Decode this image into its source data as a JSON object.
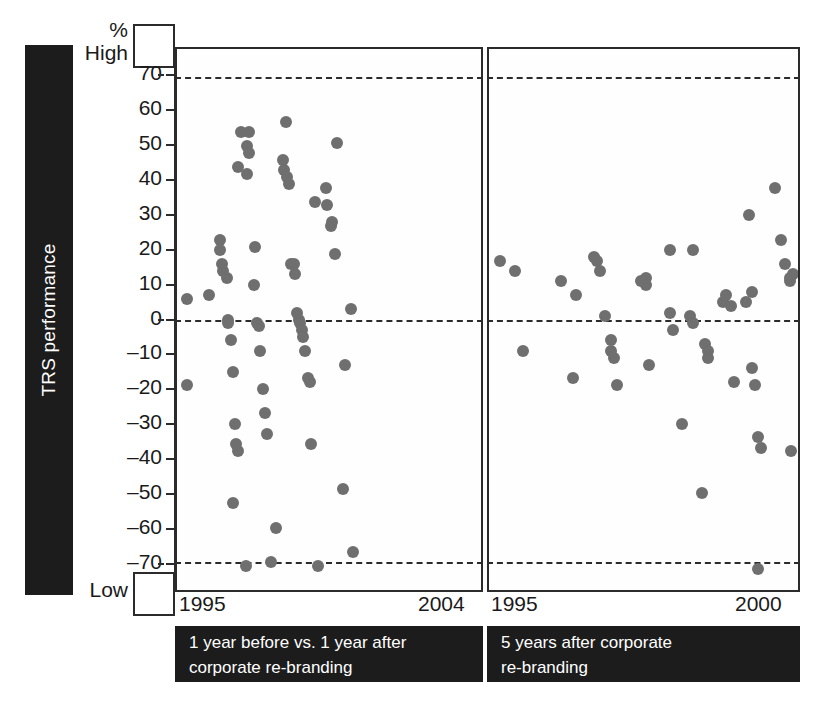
{
  "axis": {
    "y_title": "TRS performance",
    "unit_label": "%",
    "high_label": "High",
    "low_label": "Low",
    "y_ticks": [
      70,
      60,
      50,
      40,
      30,
      20,
      10,
      0,
      -10,
      -20,
      -30,
      -40,
      -50,
      -60,
      -70
    ],
    "y_tick_labels": [
      "70",
      "60",
      "50",
      "40",
      "30",
      "20",
      "10",
      "0",
      "–10",
      "–20",
      "–30",
      "–40",
      "–50",
      "–60",
      "–70"
    ]
  },
  "panels": {
    "left": {
      "x_start_label": "1995",
      "x_end_label": "2004",
      "caption_line1": "1 year before vs. 1 year after",
      "caption_line2": "corporate re-branding"
    },
    "right": {
      "x_start_label": "1995",
      "x_end_label": "2000",
      "caption_line1": "5 years after corporate",
      "caption_line2": "re-branding"
    }
  },
  "colors": {
    "dot": "#6f6f6f",
    "panel_border": "#2b2b2b",
    "caption_background": "#1c1c1c",
    "caption_text": "#ffffff",
    "background": "#ffffff"
  },
  "chart_data": [
    {
      "type": "scatter",
      "title": "1 year before vs. 1 year after corporate re-branding",
      "xlabel": "",
      "ylabel": "TRS performance",
      "xlim": [
        1995,
        2004
      ],
      "ylim": [
        -78,
        78
      ],
      "grid": false,
      "reference_lines": [
        70,
        0,
        -70
      ],
      "xticks": [
        1995,
        2004
      ],
      "yticks": [
        70,
        60,
        50,
        40,
        30,
        20,
        10,
        0,
        -10,
        -20,
        -30,
        -40,
        -50,
        -60,
        -70
      ],
      "points": [
        {
          "x": 1995.05,
          "y": 6
        },
        {
          "x": 1995.05,
          "y": -19
        },
        {
          "x": 1995.75,
          "y": 7
        },
        {
          "x": 1996.1,
          "y": 23
        },
        {
          "x": 1996.1,
          "y": 20
        },
        {
          "x": 1996.15,
          "y": 16
        },
        {
          "x": 1996.2,
          "y": 14
        },
        {
          "x": 1996.3,
          "y": 12
        },
        {
          "x": 1996.35,
          "y": 0
        },
        {
          "x": 1996.35,
          "y": -1
        },
        {
          "x": 1996.45,
          "y": -6
        },
        {
          "x": 1996.5,
          "y": -15
        },
        {
          "x": 1996.55,
          "y": -30
        },
        {
          "x": 1996.6,
          "y": -36
        },
        {
          "x": 1996.65,
          "y": -38
        },
        {
          "x": 1996.5,
          "y": -53
        },
        {
          "x": 1996.9,
          "y": -71
        },
        {
          "x": 1996.65,
          "y": 44
        },
        {
          "x": 1996.95,
          "y": 50
        },
        {
          "x": 1997.0,
          "y": 54
        },
        {
          "x": 1997.0,
          "y": 48
        },
        {
          "x": 1996.75,
          "y": 54
        },
        {
          "x": 1996.95,
          "y": 42
        },
        {
          "x": 1997.15,
          "y": 10
        },
        {
          "x": 1997.2,
          "y": 21
        },
        {
          "x": 1997.25,
          "y": -1
        },
        {
          "x": 1997.3,
          "y": -2
        },
        {
          "x": 1997.35,
          "y": -9
        },
        {
          "x": 1997.45,
          "y": -20
        },
        {
          "x": 1997.5,
          "y": -27
        },
        {
          "x": 1997.55,
          "y": -33
        },
        {
          "x": 1997.7,
          "y": -70
        },
        {
          "x": 1997.85,
          "y": -60
        },
        {
          "x": 1998.15,
          "y": 57
        },
        {
          "x": 1998.05,
          "y": 46
        },
        {
          "x": 1998.1,
          "y": 43
        },
        {
          "x": 1998.2,
          "y": 41
        },
        {
          "x": 1998.25,
          "y": 39
        },
        {
          "x": 1998.3,
          "y": 16
        },
        {
          "x": 1998.4,
          "y": 16
        },
        {
          "x": 1998.45,
          "y": 13
        },
        {
          "x": 1998.5,
          "y": 2
        },
        {
          "x": 1998.55,
          "y": 0
        },
        {
          "x": 1998.6,
          "y": -1
        },
        {
          "x": 1998.65,
          "y": -3
        },
        {
          "x": 1998.7,
          "y": -5
        },
        {
          "x": 1998.75,
          "y": -9
        },
        {
          "x": 1998.85,
          "y": -17
        },
        {
          "x": 1998.9,
          "y": -18
        },
        {
          "x": 1998.95,
          "y": -36
        },
        {
          "x": 1999.15,
          "y": -71
        },
        {
          "x": 1999.05,
          "y": 34
        },
        {
          "x": 1999.4,
          "y": 38
        },
        {
          "x": 1999.45,
          "y": 33
        },
        {
          "x": 1999.55,
          "y": 27
        },
        {
          "x": 1999.6,
          "y": 28
        },
        {
          "x": 1999.7,
          "y": 19
        },
        {
          "x": 1999.75,
          "y": 51
        },
        {
          "x": 1999.95,
          "y": -49
        },
        {
          "x": 2000.0,
          "y": -13
        },
        {
          "x": 2000.2,
          "y": 3
        },
        {
          "x": 2000.25,
          "y": -67
        }
      ]
    },
    {
      "type": "scatter",
      "title": "5 years after corporate re-branding",
      "xlabel": "",
      "ylabel": "TRS performance",
      "xlim": [
        1995,
        2000
      ],
      "ylim": [
        -78,
        78
      ],
      "grid": false,
      "reference_lines": [
        70,
        0,
        -70
      ],
      "xticks": [
        1995,
        2000
      ],
      "yticks": [
        70,
        60,
        50,
        40,
        30,
        20,
        10,
        0,
        -10,
        -20,
        -30,
        -40,
        -50,
        -60,
        -70
      ],
      "points": [
        {
          "x": 1995.05,
          "y": 17
        },
        {
          "x": 1995.3,
          "y": 14
        },
        {
          "x": 1995.45,
          "y": -9
        },
        {
          "x": 1996.1,
          "y": 11
        },
        {
          "x": 1996.35,
          "y": 7
        },
        {
          "x": 1996.3,
          "y": -17
        },
        {
          "x": 1996.65,
          "y": 18
        },
        {
          "x": 1996.7,
          "y": 17
        },
        {
          "x": 1996.75,
          "y": 14
        },
        {
          "x": 1996.85,
          "y": 1
        },
        {
          "x": 1996.95,
          "y": -6
        },
        {
          "x": 1996.95,
          "y": -9
        },
        {
          "x": 1997.0,
          "y": -11
        },
        {
          "x": 1997.05,
          "y": -19
        },
        {
          "x": 1997.45,
          "y": 11
        },
        {
          "x": 1997.5,
          "y": 11
        },
        {
          "x": 1997.55,
          "y": 10
        },
        {
          "x": 1997.55,
          "y": 12
        },
        {
          "x": 1997.6,
          "y": -13
        },
        {
          "x": 1997.95,
          "y": 20
        },
        {
          "x": 1997.95,
          "y": 2
        },
        {
          "x": 1998.0,
          "y": -3
        },
        {
          "x": 1998.15,
          "y": -30
        },
        {
          "x": 1998.35,
          "y": 20
        },
        {
          "x": 1998.3,
          "y": 1
        },
        {
          "x": 1998.35,
          "y": -1
        },
        {
          "x": 1998.55,
          "y": -7
        },
        {
          "x": 1998.6,
          "y": -9
        },
        {
          "x": 1998.6,
          "y": -11
        },
        {
          "x": 1998.5,
          "y": -50
        },
        {
          "x": 1998.85,
          "y": 5
        },
        {
          "x": 1998.9,
          "y": 7
        },
        {
          "x": 1999.0,
          "y": 4
        },
        {
          "x": 1999.05,
          "y": -18
        },
        {
          "x": 1999.3,
          "y": 30
        },
        {
          "x": 1999.25,
          "y": 5
        },
        {
          "x": 1999.35,
          "y": 8
        },
        {
          "x": 1999.35,
          "y": -14
        },
        {
          "x": 1999.4,
          "y": -19
        },
        {
          "x": 1999.45,
          "y": -34
        },
        {
          "x": 1999.5,
          "y": -37
        },
        {
          "x": 1999.45,
          "y": -72
        },
        {
          "x": 1999.75,
          "y": 38
        },
        {
          "x": 1999.85,
          "y": 23
        },
        {
          "x": 1999.92,
          "y": 16
        },
        {
          "x": 2000.0,
          "y": 12
        },
        {
          "x": 2000.0,
          "y": 11
        },
        {
          "x": 2000.05,
          "y": 13
        },
        {
          "x": 2000.02,
          "y": -38
        }
      ]
    }
  ]
}
